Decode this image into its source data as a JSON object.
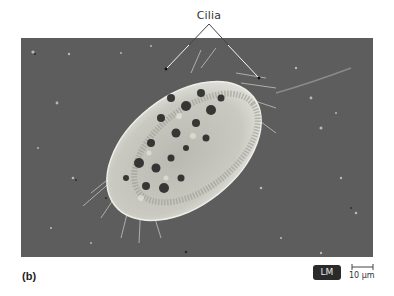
{
  "figure": {
    "panel_letter": "(b)",
    "annotation_label": "Cilia",
    "microscopy_badge": "LM",
    "scale_bar_label": "10 µm",
    "colors": {
      "background": "#5d5d5d",
      "cell_body": "#cfcfc6",
      "vacuoles": "#1e1e1e",
      "badge_bg": "#2a2a2a",
      "leader_lines": "#ffffff"
    }
  }
}
